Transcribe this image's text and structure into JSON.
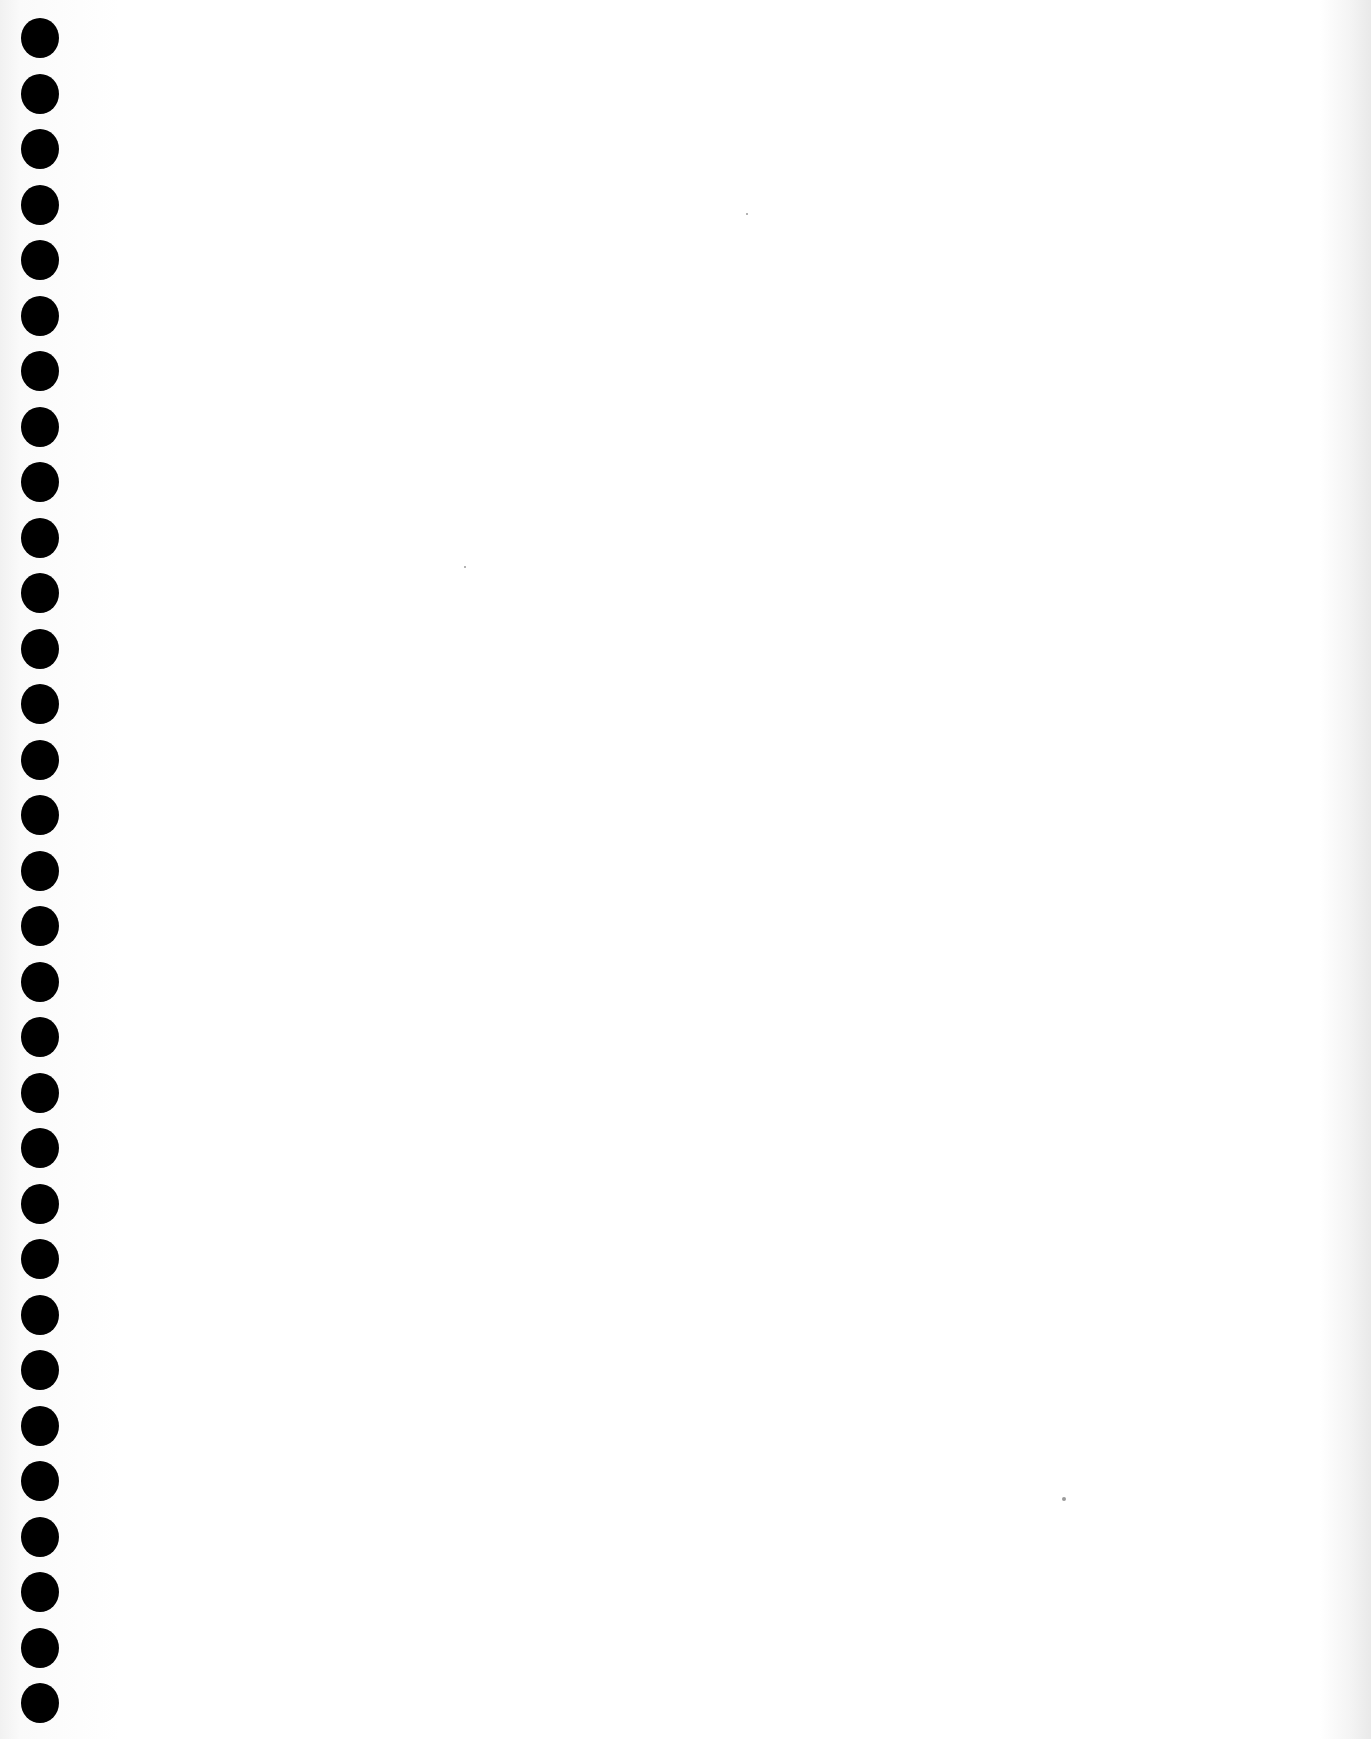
{
  "document": {
    "type": "blank notebook page",
    "binding": {
      "side": "left",
      "hole_count": 31,
      "hole_color": "#000000",
      "first_hole_y": 18,
      "hole_spacing": 55.5
    },
    "paper_color": "#ffffff",
    "text": ""
  }
}
